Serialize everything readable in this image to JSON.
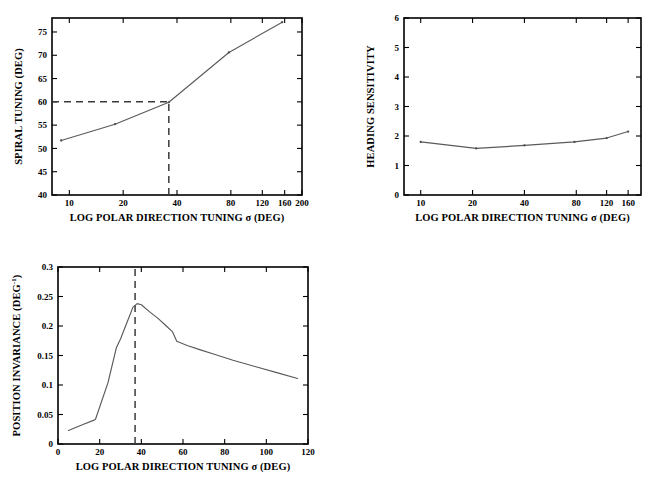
{
  "figure": {
    "background": "#ffffff",
    "curve_color": "#5a5a5a",
    "axis_color": "#000000",
    "guide_color": "#3b3b3b"
  },
  "panels": {
    "spiral": {
      "name": "spiral-tuning-panel",
      "chart_data": {
        "type": "line",
        "title": "",
        "xlabel": "LOG POLAR DIRECTION TUNING σ (DEG)",
        "ylabel": "SPIRAL TUNING (DEG)",
        "xscale": "log",
        "xlim": [
          8,
          200
        ],
        "ylim": [
          40,
          78
        ],
        "xticks": [
          10,
          20,
          40,
          80,
          120,
          160,
          200
        ],
        "xticklabels": [
          "10",
          "20",
          "40",
          "80",
          "120",
          "160",
          "200"
        ],
        "yticks": [
          40,
          45,
          50,
          55,
          60,
          65,
          70,
          75
        ],
        "yticklabels": [
          "40",
          "45",
          "50",
          "55",
          "60",
          "65",
          "70",
          "75"
        ],
        "grid": false,
        "legend": "none",
        "x": [
          9,
          18,
          36,
          78,
          155
        ],
        "y": [
          51.7,
          55.2,
          59.9,
          70.6,
          77.1
        ],
        "annotations": {
          "guide_x": 36,
          "guide_y": 60,
          "guide_style": "dashed-crosshair"
        }
      }
    },
    "heading": {
      "name": "heading-sensitivity-panel",
      "chart_data": {
        "type": "line",
        "title": "",
        "xlabel": "LOG POLAR DIRECTION TUNING σ (DEG)",
        "ylabel": "HEADING SENSITIVITY",
        "xscale": "log",
        "xlim": [
          8,
          190
        ],
        "ylim": [
          0,
          6
        ],
        "xticks": [
          10,
          20,
          40,
          80,
          120,
          160
        ],
        "xticklabels": [
          "10",
          "20",
          "40",
          "80",
          "120",
          "160"
        ],
        "yticks": [
          0,
          1,
          2,
          3,
          4,
          5,
          6
        ],
        "yticklabels": [
          "0",
          "1",
          "2",
          "3",
          "4",
          "5",
          "6"
        ],
        "grid": false,
        "legend": "none",
        "x": [
          10,
          21,
          40,
          78,
          120,
          160
        ],
        "y": [
          1.8,
          1.58,
          1.68,
          1.8,
          1.93,
          2.15
        ],
        "annotations": {}
      }
    },
    "position": {
      "name": "position-invariance-panel",
      "chart_data": {
        "type": "line",
        "title": "",
        "xlabel": "LOG POLAR DIRECTION TUNING σ (DEG)",
        "ylabel_main": "POSITION INVARIANCE (DEG",
        "ylabel_sup": "-1",
        "ylabel_tail": ")",
        "ylabel": "POSITION INVARIANCE (DEG-1)",
        "xscale": "linear",
        "xlim": [
          0,
          120
        ],
        "ylim": [
          0,
          0.3
        ],
        "xticks": [
          0,
          20,
          40,
          60,
          80,
          100,
          120
        ],
        "xticklabels": [
          "0",
          "20",
          "40",
          "60",
          "80",
          "100",
          "120"
        ],
        "yticks": [
          0,
          0.05,
          0.1,
          0.15,
          0.2,
          0.25,
          0.3
        ],
        "yticklabels": [
          "0",
          "0.05",
          "0.1",
          "0.15",
          "0.2",
          "0.25",
          "0.3"
        ],
        "grid": false,
        "legend": "none",
        "x": [
          5,
          12,
          17,
          18,
          24,
          28,
          30,
          33,
          36,
          38,
          40,
          44,
          48,
          52,
          55,
          57,
          62,
          68,
          75,
          84,
          95,
          105,
          115
        ],
        "y": [
          0.023,
          0.033,
          0.04,
          0.042,
          0.104,
          0.163,
          0.178,
          0.205,
          0.232,
          0.238,
          0.236,
          0.224,
          0.213,
          0.2,
          0.19,
          0.174,
          0.167,
          0.16,
          0.152,
          0.142,
          0.131,
          0.121,
          0.111
        ],
        "annotations": {
          "guide_x": 37,
          "guide_style": "dashed-vertical"
        }
      }
    }
  },
  "caption": {
    "partial_text": ""
  }
}
